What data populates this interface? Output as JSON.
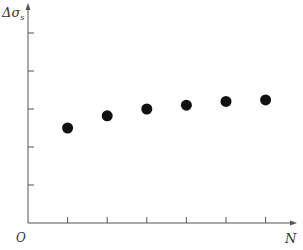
{
  "chart_data": {
    "type": "scatter",
    "title": "",
    "xlabel": "N",
    "ylabel": "Δσ_s",
    "origin_label": "O",
    "x_ticks": [
      1,
      2,
      3,
      4,
      5,
      6
    ],
    "y_ticks": [
      1,
      2,
      3,
      4,
      5
    ],
    "x_tick_labels": [],
    "y_tick_labels": [],
    "xlim": [
      0,
      6.6
    ],
    "ylim": [
      0,
      5.8
    ],
    "grid": false,
    "legend": null,
    "series": [
      {
        "name": "data",
        "x": [
          1,
          2,
          3,
          4,
          5,
          6
        ],
        "y": [
          2.5,
          2.82,
          3.0,
          3.1,
          3.2,
          3.24
        ]
      }
    ]
  },
  "labels": {
    "y_axis_main": "Δσ",
    "y_axis_sub": "s",
    "x_axis": "N",
    "origin": "O"
  },
  "colors": {
    "axis": "#555555",
    "marker": "#111111"
  }
}
